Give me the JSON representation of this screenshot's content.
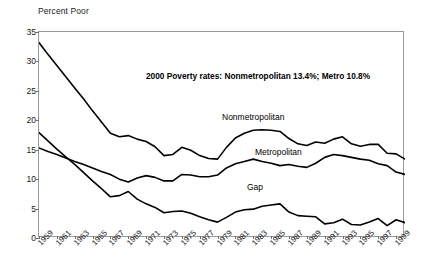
{
  "chart_data": {
    "type": "line",
    "title": "",
    "ylabel": "Percent Poor",
    "xlabel": "",
    "ylim": [
      0,
      35
    ],
    "ytick_values": [
      0,
      5,
      10,
      15,
      20,
      25,
      30,
      35
    ],
    "grid": false,
    "legend_position": "inline-annotations",
    "x": [
      1959,
      1960,
      1961,
      1962,
      1963,
      1964,
      1965,
      1966,
      1967,
      1968,
      1969,
      1970,
      1971,
      1972,
      1973,
      1974,
      1975,
      1976,
      1977,
      1978,
      1979,
      1980,
      1981,
      1982,
      1983,
      1984,
      1985,
      1986,
      1987,
      1988,
      1989,
      1990,
      1991,
      1992,
      1993,
      1994,
      1995,
      1996,
      1997,
      1998,
      1999,
      2000
    ],
    "xtick_labels": [
      "1959",
      "1961",
      "1963",
      "1965",
      "1967",
      "1969",
      "1971",
      "1973",
      "1975",
      "1977",
      "1979",
      "1981",
      "1983",
      "1985",
      "1987",
      "1989",
      "1991",
      "1993",
      "1995",
      "1997",
      "1999"
    ],
    "series": [
      {
        "name": "Nonmetropolitan",
        "values": [
          33.2,
          31.2,
          29.3,
          27.4,
          25.5,
          23.6,
          21.6,
          19.7,
          17.8,
          17.2,
          17.4,
          16.8,
          16.4,
          15.5,
          14.0,
          14.2,
          15.4,
          14.9,
          14.0,
          13.5,
          13.4,
          15.4,
          17.0,
          17.8,
          18.3,
          18.4,
          18.3,
          18.1,
          16.9,
          16.0,
          15.7,
          16.3,
          16.1,
          16.8,
          17.2,
          16.0,
          15.6,
          15.9,
          15.9,
          14.4,
          14.3,
          13.4
        ]
      },
      {
        "name": "Metropolitan",
        "values": [
          15.3,
          14.7,
          14.2,
          13.6,
          13.0,
          12.5,
          11.9,
          11.3,
          10.8,
          10.0,
          9.5,
          10.2,
          10.6,
          10.3,
          9.7,
          9.7,
          10.8,
          10.7,
          10.4,
          10.4,
          10.7,
          11.9,
          12.6,
          13.0,
          13.4,
          13.0,
          12.7,
          12.3,
          12.5,
          12.2,
          12.0,
          12.7,
          13.7,
          14.2,
          14.0,
          13.7,
          13.4,
          13.2,
          12.6,
          12.3,
          11.2,
          10.8
        ]
      },
      {
        "name": "Gap",
        "values": [
          17.9,
          16.5,
          15.1,
          13.8,
          12.5,
          11.1,
          9.7,
          8.4,
          7.0,
          7.2,
          7.9,
          6.6,
          5.8,
          5.2,
          4.3,
          4.5,
          4.6,
          4.2,
          3.6,
          3.1,
          2.7,
          3.5,
          4.4,
          4.8,
          4.9,
          5.4,
          5.6,
          5.8,
          4.4,
          3.8,
          3.7,
          3.6,
          2.4,
          2.6,
          3.2,
          2.3,
          2.2,
          2.7,
          3.3,
          2.1,
          3.1,
          2.6
        ]
      }
    ],
    "annotations": [
      "2000 Poverty rates: Nonmetropolitan 13.4%;  Metro 10.8%"
    ],
    "series_labels": {
      "nonmetro": "Nonmetropolitan",
      "metro": "Metropolitan",
      "gap": "Gap"
    }
  }
}
